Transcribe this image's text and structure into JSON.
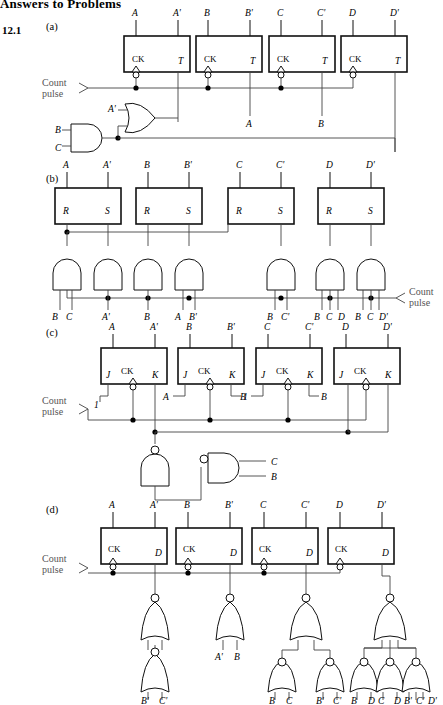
{
  "page": {
    "heading": "Answers to Problems",
    "problem_number": "12.1"
  },
  "labels": {
    "count": "Count",
    "pulse": "pulse",
    "ck": "CK",
    "T": "T",
    "R": "R",
    "S": "S",
    "J": "J",
    "K": "K",
    "D": "D",
    "one": "1",
    "A": "A",
    "Ap": "A'",
    "B": "B",
    "Bp": "B'",
    "C": "C",
    "Cp": "C'",
    "D4": "D",
    "Dp": "D'"
  },
  "parts": [
    {
      "id": "a",
      "label": "(a)",
      "flipflop_type": "T",
      "outputs": [
        "A",
        "A'",
        "B",
        "B'",
        "C",
        "C'",
        "D",
        "D'"
      ],
      "stage_inputs": [
        "",
        "A",
        "B",
        ""
      ],
      "gates": [
        {
          "type": "or",
          "inputs": [
            "A'",
            ""
          ],
          "name": "or-gate-a"
        },
        {
          "type": "and",
          "inputs": [
            "B",
            "C"
          ],
          "name": "and-gate-a"
        }
      ]
    },
    {
      "id": "b",
      "label": "(b)",
      "flipflop_type": "R-S",
      "outputs": [
        "A",
        "A'",
        "B",
        "B'",
        "C",
        "C'",
        "D",
        "D'"
      ],
      "pin_labels": [
        "R",
        "S"
      ],
      "gate_inputs": [
        "B C",
        "A'",
        "B",
        "A B'",
        "B C'",
        "B C D",
        "B C D'"
      ],
      "gate_input_groups": [
        [
          "B",
          "C"
        ],
        [
          "A'"
        ],
        [
          "B"
        ],
        [
          "A",
          "B'"
        ],
        [
          "B",
          "C'"
        ],
        [
          "B",
          "C",
          "D"
        ],
        [
          "B",
          "C",
          "D'"
        ]
      ]
    },
    {
      "id": "c",
      "label": "(c)",
      "flipflop_type": "J-K",
      "outputs": [
        "A",
        "A'",
        "B",
        "B'",
        "C",
        "C'",
        "D",
        "D'"
      ],
      "pin_labels": [
        "J",
        "CK",
        "K"
      ],
      "jk_inputs": [
        [
          "1",
          ""
        ],
        [
          "A",
          "1"
        ],
        [
          "B",
          "B"
        ],
        [
          "",
          ""
        ]
      ],
      "nand_outputs": [
        "C",
        "B"
      ]
    },
    {
      "id": "d",
      "label": "(d)",
      "flipflop_type": "D",
      "outputs": [
        "A",
        "A'",
        "B",
        "B'",
        "C",
        "C'",
        "D",
        "D'"
      ],
      "nor_input_labels": [
        [
          "B'",
          "C'"
        ],
        [
          "A'",
          "B"
        ],
        [
          "B",
          "C"
        ],
        [
          "B'",
          "C'"
        ],
        [
          "B",
          "D"
        ],
        [
          "C",
          "D"
        ],
        [
          "B'",
          "C'",
          "D'"
        ]
      ]
    }
  ],
  "colors": {
    "wire": "#444",
    "outline": "#111",
    "text": "#000",
    "muted": "#555"
  }
}
